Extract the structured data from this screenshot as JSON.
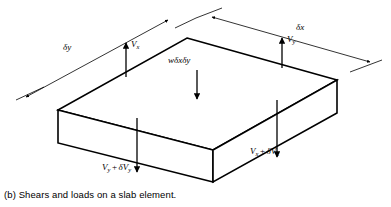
{
  "figure": {
    "caption": "(b)  Shears and loads on a slab element.",
    "caption_part_label": "(b)",
    "caption_text": "Shears and loads on a slab element.",
    "background_color": "#ffffff",
    "line_color": "#000000",
    "width": 391,
    "height": 207
  },
  "dimensions": [
    {
      "id": "delta-y",
      "symbol": "δ",
      "subject": "y",
      "label": "δy",
      "description": "slab element width along y, dimension line upper-left",
      "label_x": 63,
      "label_y": 48
    },
    {
      "id": "delta-x",
      "symbol": "δ",
      "subject": "x",
      "label": "δx",
      "description": "slab element width along x, dimension line upper-right",
      "label_x": 299,
      "label_y": 28
    }
  ],
  "loads": [
    {
      "id": "load-w",
      "label": "wδxδy",
      "description": "distributed load on slab element, arrow pointing down",
      "arrow_direction": "down",
      "label_x": 173,
      "label_y": 62
    }
  ],
  "shears": [
    {
      "id": "shear-vx",
      "base": "V",
      "sub": "x",
      "label": "V",
      "subscript": "x",
      "description": "shear Vx on left edge, arrow pointing up",
      "arrow_direction": "up",
      "label_x": 130,
      "label_y": 46
    },
    {
      "id": "shear-vy",
      "base": "V",
      "sub": "y",
      "label": "V",
      "subscript": "y",
      "description": "shear Vy on back-right edge, arrow pointing up",
      "arrow_direction": "up",
      "label_x": 286,
      "label_y": 41
    },
    {
      "id": "shear-vy-plus-dvy",
      "base": "V",
      "sub": "y",
      "increment_symbol": "δ",
      "label_first": "V",
      "subscript_first": "y",
      "plus": "+",
      "label_second": "δV",
      "subscript_second": "y",
      "description": "shear Vy + δVy on front-left edge, arrow pointing down",
      "arrow_direction": "down",
      "label_x": 104,
      "label_y": 169
    },
    {
      "id": "shear-vx-plus-dvx",
      "base": "V",
      "sub": "x",
      "increment_symbol": "δ",
      "label_first": "V",
      "subscript_first": "x",
      "plus": "+",
      "label_second": "δV",
      "subscript_second": "x",
      "description": "shear Vx + δVx on front-right edge, arrow pointing down",
      "arrow_direction": "down",
      "label_x": 253,
      "label_y": 153
    }
  ]
}
